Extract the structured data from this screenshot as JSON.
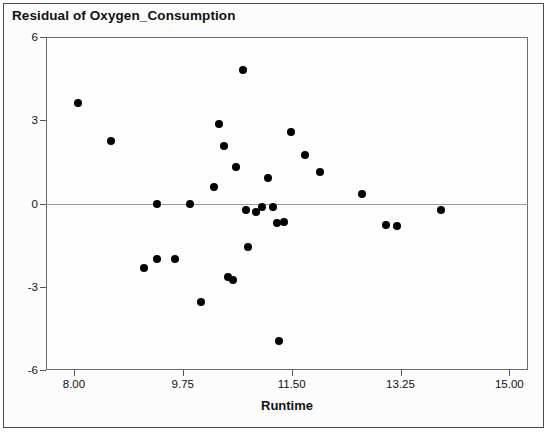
{
  "title": "Residual of Oxygen_Consumption",
  "axis": {
    "x_title": "Runtime",
    "x_ticks": [
      "8.00",
      "9.75",
      "11.50",
      "13.25",
      "15.00"
    ],
    "y_ticks": [
      "6",
      "3",
      "0",
      "-3",
      "-6"
    ]
  },
  "colors": {
    "marker": "#000000",
    "zero_line": "#9a9a9a",
    "frame": "#6b6b6b",
    "background": "#fdfdfd"
  },
  "chart_data": {
    "type": "scatter",
    "title": "Residual of Oxygen_Consumption",
    "xlabel": "Runtime",
    "ylabel": "",
    "xlim": [
      7.55,
      15.3
    ],
    "ylim": [
      -6,
      6
    ],
    "xticks": [
      8.0,
      9.75,
      11.5,
      13.25,
      15.0
    ],
    "yticks": [
      -6,
      -3,
      0,
      3,
      6
    ],
    "grid": false,
    "legend": null,
    "reference_lines": [
      {
        "axis": "y",
        "value": 0
      }
    ],
    "series": [
      {
        "name": "Residuals",
        "marker": "filled-circle",
        "color": "#000000",
        "points": [
          {
            "x": 8.06,
            "y": 3.62
          },
          {
            "x": 8.6,
            "y": 2.26
          },
          {
            "x": 9.12,
            "y": -2.34
          },
          {
            "x": 9.33,
            "y": -1.99
          },
          {
            "x": 9.34,
            "y": 0.0
          },
          {
            "x": 9.62,
            "y": -2.0
          },
          {
            "x": 9.87,
            "y": 0.0
          },
          {
            "x": 10.05,
            "y": -3.56
          },
          {
            "x": 10.25,
            "y": 0.61
          },
          {
            "x": 10.33,
            "y": 2.85
          },
          {
            "x": 10.42,
            "y": 2.07
          },
          {
            "x": 10.47,
            "y": -2.65
          },
          {
            "x": 10.55,
            "y": -2.74
          },
          {
            "x": 10.6,
            "y": 1.3
          },
          {
            "x": 10.72,
            "y": 4.8
          },
          {
            "x": 10.76,
            "y": -0.25
          },
          {
            "x": 10.8,
            "y": -1.55
          },
          {
            "x": 10.93,
            "y": -0.3
          },
          {
            "x": 11.03,
            "y": -0.14
          },
          {
            "x": 11.12,
            "y": 0.91
          },
          {
            "x": 11.2,
            "y": -0.14
          },
          {
            "x": 11.26,
            "y": -0.72
          },
          {
            "x": 11.3,
            "y": -4.95
          },
          {
            "x": 11.38,
            "y": -0.65
          },
          {
            "x": 11.49,
            "y": 2.58
          },
          {
            "x": 11.72,
            "y": 1.73
          },
          {
            "x": 11.95,
            "y": 1.12
          },
          {
            "x": 12.63,
            "y": 0.36
          },
          {
            "x": 13.02,
            "y": -0.76
          },
          {
            "x": 13.19,
            "y": -0.8
          },
          {
            "x": 13.9,
            "y": -0.25
          }
        ]
      }
    ]
  }
}
